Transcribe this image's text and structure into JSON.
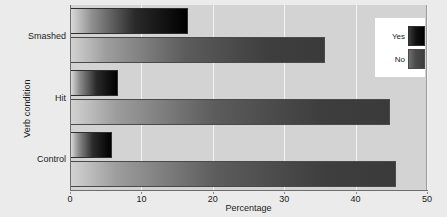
{
  "chart_data": {
    "type": "bar",
    "orientation": "horizontal",
    "title": "",
    "xlabel": "Percentage",
    "ylabel": "Verb condition",
    "categories": [
      "Control",
      "Hit",
      "Smashed"
    ],
    "xlim": [
      0,
      50
    ],
    "xticks": [
      0,
      10,
      20,
      30,
      40,
      50
    ],
    "xtick_labels": [
      "0",
      "10",
      "20",
      "30",
      "40",
      "50"
    ],
    "grid": true,
    "grid_axis": "x",
    "legend": {
      "position": "top-right",
      "entries": [
        {
          "label": "Yes",
          "color": "#000000"
        },
        {
          "label": "No",
          "color": "#3e3e3e"
        }
      ]
    },
    "series": [
      {
        "name": "Yes",
        "color": "#000000",
        "values": [
          5.9,
          6.7,
          16.5
        ]
      },
      {
        "name": "No",
        "color": "#3e3e3e",
        "values": [
          45.7,
          44.8,
          35.7
        ]
      }
    ],
    "colors": {
      "panel_background": "#d3d3d3",
      "figure_background": "#ebebeb",
      "gridline": "#f3f3f3",
      "axis": "#6e6e6e",
      "text": "#1c1c1c",
      "legend_background": "#ffffff"
    }
  }
}
